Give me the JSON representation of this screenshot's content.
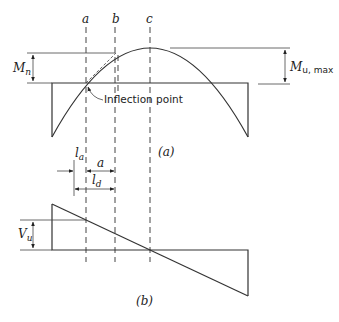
{
  "figure": {
    "section_labels": {
      "a": "a",
      "b": "b",
      "c": "c"
    },
    "moment_diagram": {
      "caption": "(a)",
      "mn_label": "M",
      "mn_sub": "n",
      "mu_label": "M",
      "mu_sub": "u, max",
      "inflection_label": "Inflection point"
    },
    "dimensions": {
      "la": "l",
      "la_sub": "a",
      "a": "a",
      "ld": "l",
      "ld_sub": "d"
    },
    "shear_diagram": {
      "caption": "(b)",
      "vu_label": "V",
      "vu_sub": "u"
    }
  }
}
